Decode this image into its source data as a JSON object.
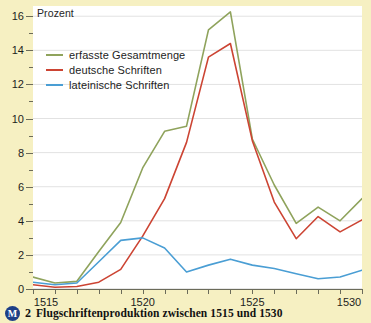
{
  "figure": {
    "background_color": "#f6f0c2",
    "plot_background_color": "#ffffff"
  },
  "caption": {
    "badge": "M",
    "number": "2",
    "text": "Flugschriftenproduktion zwischen 1515 und 1530"
  },
  "legend": {
    "position": "top-left-inside",
    "items": [
      {
        "label": "erfasste Gesamtmenge",
        "color": "#8fa35c"
      },
      {
        "label": "deutsche Schriften",
        "color": "#cc4433"
      },
      {
        "label": "lateinische Schriften",
        "color": "#4a9ed4"
      }
    ]
  },
  "chart_data": {
    "type": "line",
    "title": "Flugschriftenproduktion zwischen 1515 und 1530",
    "xlabel": "",
    "ylabel": "Prozent",
    "ylim": [
      0,
      16.6
    ],
    "xlim": [
      1515,
      1530
    ],
    "grid": true,
    "y_major_ticks": [
      0,
      2,
      4,
      6,
      8,
      10,
      12,
      14,
      16
    ],
    "y_minor_step": 1,
    "y_tick_labels": [
      "0",
      "2",
      "4",
      "6",
      "8",
      "10",
      "12",
      "14",
      "16"
    ],
    "x_ticks": [
      1515,
      1516,
      1517,
      1518,
      1519,
      1520,
      1521,
      1522,
      1523,
      1524,
      1525,
      1526,
      1527,
      1528,
      1529,
      1530
    ],
    "x_tick_labels_shown": [
      "1515",
      "1520",
      "1525",
      "1530"
    ],
    "x": [
      1515,
      1516,
      1517,
      1518,
      1519,
      1520,
      1521,
      1522,
      1523,
      1524,
      1525,
      1526,
      1527,
      1528,
      1529,
      1530
    ],
    "series": [
      {
        "name": "erfasste Gesamtmenge",
        "color": "#8fa35c",
        "values": [
          0.7,
          0.35,
          0.45,
          2.2,
          3.9,
          7.1,
          9.25,
          9.55,
          15.2,
          16.25,
          8.8,
          6.1,
          3.85,
          4.8,
          4.0,
          5.3
        ]
      },
      {
        "name": "deutsche Schriften",
        "color": "#cc4433",
        "values": [
          0.25,
          0.1,
          0.15,
          0.4,
          1.15,
          3.1,
          5.3,
          8.6,
          13.6,
          14.4,
          8.7,
          5.1,
          2.95,
          4.25,
          3.35,
          4.05
        ]
      },
      {
        "name": "lateinische Schriften",
        "color": "#4a9ed4",
        "values": [
          0.4,
          0.25,
          0.35,
          1.6,
          2.85,
          3.0,
          2.4,
          1.0,
          1.4,
          1.75,
          1.4,
          1.2,
          0.9,
          0.6,
          0.7,
          1.1
        ]
      }
    ]
  }
}
